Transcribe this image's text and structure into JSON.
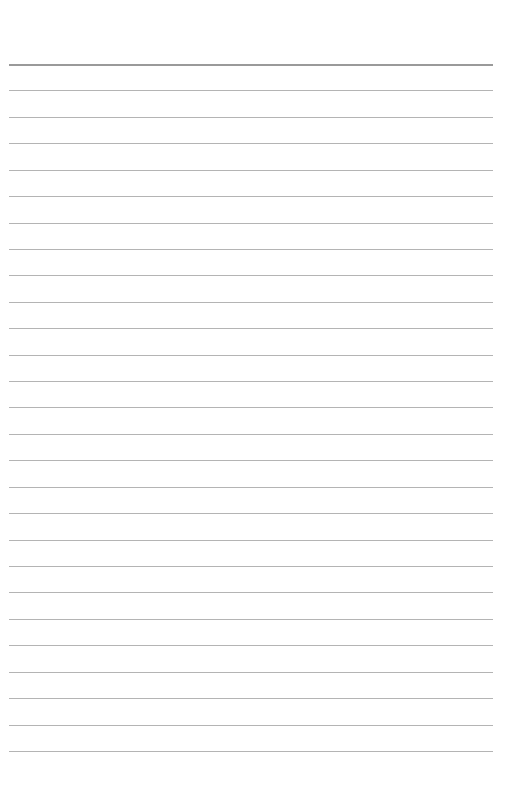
{
  "page": {
    "type": "ruled-paper",
    "background_color": "#ffffff",
    "rule_color": "#b4b4b4",
    "header_rule_color": "#9a9a9a",
    "rule_count": 27,
    "first_rule_y": 64,
    "rule_spacing": 26.42,
    "rule_left": 9,
    "rule_width": 484,
    "text": []
  }
}
